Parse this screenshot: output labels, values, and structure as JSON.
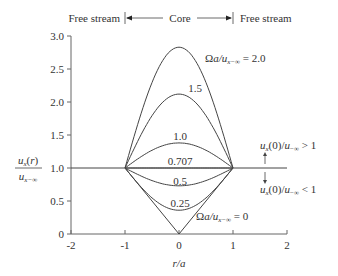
{
  "chart_data": {
    "type": "line",
    "title": "",
    "xlabel": "r/a",
    "ylabel_num": "u_x(r)",
    "ylabel_den": "u_x,-inf",
    "xlim": [
      -2,
      2
    ],
    "ylim": [
      0,
      3.0
    ],
    "xticks": [
      -2,
      -1,
      0,
      1,
      2
    ],
    "xtick_labels": [
      "-2",
      "-1",
      "0",
      "1",
      "2"
    ],
    "yticks": [
      0,
      0.5,
      1.0,
      1.5,
      2.0,
      2.5,
      3.0
    ],
    "ytick_labels": [
      "0",
      "0.5",
      "1.0",
      "1.5",
      "2.0",
      "2.5",
      "3.0"
    ],
    "grid": false,
    "free_stream_level": 1.0,
    "series": [
      {
        "name": "2.0",
        "center_value": 2.83,
        "label": "Ωa/u_x,-∞ = 2.0"
      },
      {
        "name": "1.5",
        "center_value": 2.12,
        "label": "1.5"
      },
      {
        "name": "1.0",
        "center_value": 1.38,
        "label": "1.0"
      },
      {
        "name": "0.707",
        "center_value": 1.0,
        "label": "0.707"
      },
      {
        "name": "0.5",
        "center_value": 0.73,
        "label": "0.5"
      },
      {
        "name": "0.25",
        "center_value": 0.36,
        "label": "0.25"
      },
      {
        "name": "0",
        "center_value": 0.0,
        "label": "Ωa/u_x,-∞ = 0"
      }
    ],
    "annotations": {
      "free_stream_left": "Free stream",
      "core": "Core",
      "free_stream_right": "Free stream",
      "above": "u_x(0)/u_-∞ > 1",
      "below": "u_x(0)/u_-∞ < 1"
    }
  }
}
